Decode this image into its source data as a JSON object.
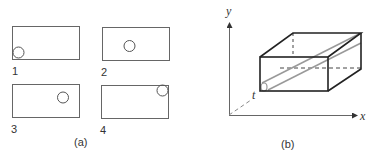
{
  "figure": {
    "panel_a": {
      "caption": "(a)",
      "frames": [
        {
          "label": "1",
          "circle_position": "bottom-left"
        },
        {
          "label": "2",
          "circle_position": "center"
        },
        {
          "label": "3",
          "circle_position": "upper-right"
        },
        {
          "label": "4",
          "circle_position": "top-right-corner"
        }
      ]
    },
    "panel_b": {
      "caption": "(b)",
      "axes": {
        "x": "x",
        "y": "y",
        "t": "t"
      }
    }
  },
  "colors": {
    "line": "#555555",
    "box_edge": "#222222",
    "tube": "#999999",
    "background": "#ffffff"
  }
}
